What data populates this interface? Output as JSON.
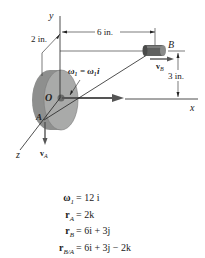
{
  "figure": {
    "axes": {
      "x_label": "x",
      "y_label": "y",
      "z_label": "z"
    },
    "points": {
      "origin": "O",
      "A": "A",
      "B": "B"
    },
    "dimensions": {
      "horizontal": "6 in.",
      "vertical": "3 in.",
      "offset": "2 in."
    },
    "annotations": {
      "omega": "ω₁ = ω₁i",
      "vA": "vA",
      "vB": "vB"
    },
    "colors": {
      "disk_face": "#a9aaa9",
      "disk_rim": "#8e8f8e",
      "arrow": "#555555",
      "line": "#222222"
    }
  },
  "equations": [
    {
      "lhs": "ω",
      "sub": "1",
      "rhs": "= 12 i"
    },
    {
      "lhs": "r",
      "sub": "A",
      "rhs": "= 2k"
    },
    {
      "lhs": "r",
      "sub": "B",
      "rhs": "= 6i + 3j"
    },
    {
      "lhs": "r",
      "sub": "B/A",
      "rhs": "= 6i + 3j − 2k"
    }
  ]
}
